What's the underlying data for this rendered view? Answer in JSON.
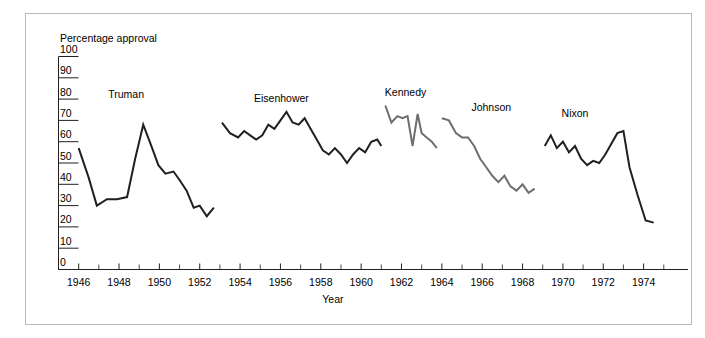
{
  "figure": {
    "frame_border_color": "#b9b9b9",
    "background": "#ffffff"
  },
  "chart_data": {
    "type": "line",
    "title": "",
    "xlabel": "Year",
    "ylabel": "Percentage approval",
    "xlim": [
      1945,
      1976.2
    ],
    "ylim": [
      0,
      100
    ],
    "grid": false,
    "legend": "inline-labels",
    "ytick_labels": [
      "0",
      "10",
      "20",
      "30",
      "40",
      "50",
      "60",
      "70",
      "80",
      "90",
      "100"
    ],
    "ytick_values": [
      0,
      10,
      20,
      30,
      40,
      50,
      60,
      70,
      80,
      90,
      100
    ],
    "xtick_labels": [
      "1946",
      "1948",
      "1950",
      "1952",
      "1954",
      "1956",
      "1958",
      "1960",
      "1962",
      "1964",
      "1966",
      "1968",
      "1970",
      "1972",
      "1974"
    ],
    "xtick_values": [
      1946,
      1948,
      1950,
      1952,
      1954,
      1956,
      1958,
      1960,
      1962,
      1964,
      1966,
      1968,
      1970,
      1972,
      1974
    ],
    "xminor_values": [
      1945,
      1947,
      1949,
      1951,
      1953,
      1955,
      1957,
      1959,
      1961,
      1963,
      1965,
      1967,
      1969,
      1971,
      1973,
      1975
    ],
    "series": [
      {
        "name": "Truman",
        "color": "#231f20",
        "label_x": 1948.35,
        "label_y": 80.5,
        "x": [
          1946.0,
          1946.5,
          1946.9,
          1947.4,
          1947.9,
          1948.4,
          1948.8,
          1949.2,
          1949.6,
          1949.95,
          1950.3,
          1950.7,
          1951.0,
          1951.35,
          1951.7,
          1952.0,
          1952.35,
          1952.7
        ],
        "y": [
          57,
          43,
          30,
          33,
          33,
          34,
          52,
          68,
          58,
          49,
          45,
          46,
          42,
          37,
          29,
          30,
          25,
          29
        ]
      },
      {
        "name": "Eisenhower",
        "color": "#231f20",
        "label_x": 1956.05,
        "label_y": 78.5,
        "x": [
          1953.1,
          1953.5,
          1953.9,
          1954.2,
          1954.5,
          1954.8,
          1955.1,
          1955.4,
          1955.7,
          1956.0,
          1956.3,
          1956.6,
          1956.9,
          1957.2,
          1957.5,
          1957.8,
          1958.1,
          1958.4,
          1958.7,
          1959.0,
          1959.3,
          1959.6,
          1959.9,
          1960.2,
          1960.5,
          1960.8,
          1961.0
        ],
        "y": [
          69,
          64,
          62,
          65,
          63,
          61,
          63,
          68,
          66,
          70,
          74,
          69,
          68,
          71,
          66,
          61,
          56,
          54,
          57,
          54,
          50,
          54,
          57,
          55,
          60,
          61,
          58
        ]
      },
      {
        "name": "Kennedy",
        "color": "#6d6e70",
        "label_x": 1962.2,
        "label_y": 81.5,
        "x": [
          1961.2,
          1961.5,
          1961.8,
          1962.05,
          1962.3,
          1962.55,
          1962.8,
          1963.0,
          1963.25,
          1963.5,
          1963.75
        ],
        "y": [
          77,
          69,
          72,
          71,
          72,
          58,
          73,
          64,
          62,
          60,
          57
        ]
      },
      {
        "name": "Johnson",
        "color": "#6d6e70",
        "label_x": 1966.45,
        "label_y": 74.5,
        "x": [
          1964.0,
          1964.35,
          1964.7,
          1965.0,
          1965.3,
          1965.6,
          1965.9,
          1966.2,
          1966.5,
          1966.8,
          1967.1,
          1967.4,
          1967.7,
          1968.0,
          1968.3,
          1968.6
        ],
        "y": [
          71,
          70,
          64,
          62,
          62,
          58,
          52,
          48,
          44,
          41,
          44,
          39,
          37,
          40,
          36,
          38
        ]
      },
      {
        "name": "Nixon",
        "color": "#231f20",
        "label_x": 1970.6,
        "label_y": 71.5,
        "x": [
          1969.1,
          1969.4,
          1969.7,
          1970.0,
          1970.3,
          1970.6,
          1970.9,
          1971.2,
          1971.5,
          1971.8,
          1972.1,
          1972.4,
          1972.7,
          1973.0,
          1973.3,
          1973.7,
          1974.1,
          1974.5
        ],
        "y": [
          58,
          63,
          57,
          60,
          55,
          58,
          52,
          49,
          51,
          50,
          54,
          59,
          64,
          65,
          48,
          35,
          23,
          22
        ]
      }
    ]
  }
}
